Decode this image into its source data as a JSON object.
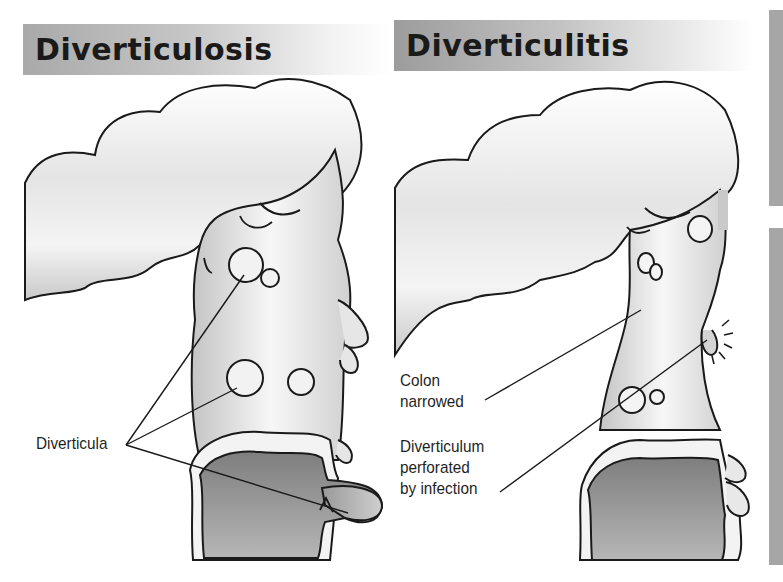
{
  "panels": {
    "left": {
      "title": "Diverticulosis",
      "labels": {
        "diverticula": "Diverticula"
      }
    },
    "right": {
      "title": "Diverticulitis",
      "labels": {
        "colon_line1": "Colon",
        "colon_line2": "narrowed",
        "perforated_line1": "Diverticulum",
        "perforated_line2": "perforated",
        "perforated_line3": "by infection"
      }
    }
  },
  "colors": {
    "title_bar": "#b0b0b0",
    "colon_fill_light": "#f2f2f2",
    "colon_fill_mid": "#cfcfcf",
    "lumen_dark": "#8a8a8a",
    "outline": "#1a1a1a",
    "side_bar": "#a6a6a6"
  }
}
